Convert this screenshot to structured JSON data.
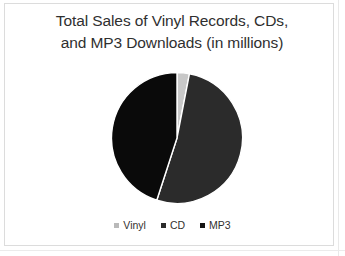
{
  "slide": {
    "title_line1": "Total Sales of Vinyl Records, CDs,",
    "title_line2": "and MP3 Downloads (in millions)",
    "background_color": "#ffffff",
    "frame_color": "#dcdcdc"
  },
  "chart_data": {
    "type": "pie",
    "title": "Total Sales of Vinyl Records, CDs, and MP3 Downloads (in millions)",
    "categories": [
      "Vinyl",
      "CD",
      "MP3"
    ],
    "values": [
      3,
      52,
      45
    ],
    "unit": "millions",
    "colors": [
      "#c8c8c8",
      "#2b2b2b",
      "#0a0a0a"
    ],
    "legend_position": "bottom",
    "grid": false,
    "slices": [
      {
        "label": "Vinyl",
        "value": 3,
        "color": "#c8c8c8",
        "start_angle": 0,
        "end_angle": 11
      },
      {
        "label": "CD",
        "value": 52,
        "color": "#2b2b2b",
        "start_angle": 11,
        "end_angle": 198
      },
      {
        "label": "MP3",
        "value": 45,
        "color": "#0a0a0a",
        "start_angle": 198,
        "end_angle": 360
      }
    ]
  },
  "legend": {
    "items": [
      {
        "label": "Vinyl",
        "color": "#b9b9b9"
      },
      {
        "label": "CD",
        "color": "#2b2b2b"
      },
      {
        "label": "MP3",
        "color": "#141414"
      }
    ]
  }
}
